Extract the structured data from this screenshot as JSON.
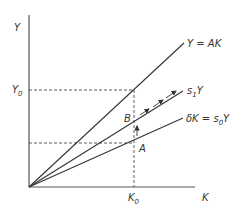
{
  "axes": {
    "y_label": "Y",
    "x_label": "K",
    "y0_label": "Y",
    "y0_sub": "0",
    "k0_label": "K",
    "k0_sub": "0"
  },
  "lines": {
    "production": "Y = AK",
    "savings_new": {
      "main": "s",
      "sub": "1",
      "tail": "Y"
    },
    "depreciation": {
      "main": "δK = s",
      "sub": "0",
      "tail": "Y"
    }
  },
  "points": {
    "a": "A",
    "b": "B"
  },
  "colors": {
    "line": "#333333",
    "background": "#ffffff"
  }
}
